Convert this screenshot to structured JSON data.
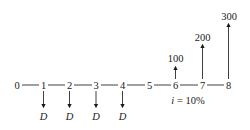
{
  "diagram": {
    "type": "cash-flow-diagram",
    "periods": [
      "0",
      "1",
      "2",
      "3",
      "4",
      "5",
      "6",
      "7",
      "8"
    ],
    "interest_rate_label": "i = 10%",
    "outflows": [
      {
        "period": "1",
        "label": "D"
      },
      {
        "period": "2",
        "label": "D"
      },
      {
        "period": "3",
        "label": "D"
      },
      {
        "period": "4",
        "label": "D"
      }
    ],
    "inflows": [
      {
        "period": "6",
        "label": "100"
      },
      {
        "period": "7",
        "label": "200"
      },
      {
        "period": "8",
        "label": "300"
      }
    ],
    "colors": {
      "ink": "#1a1a1a",
      "background": "#ffffff"
    }
  }
}
